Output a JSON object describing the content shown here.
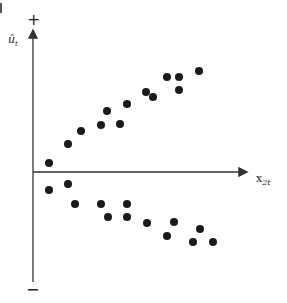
{
  "chart_data": {
    "type": "scatter",
    "title": "",
    "xlabel": "x_2t",
    "ylabel": "û_t",
    "x_axis_label": {
      "base": "x",
      "sub": "2t"
    },
    "y_axis_label": {
      "base": "û",
      "sub": "t"
    },
    "y_positive_marker": "+",
    "y_negative_marker": "−",
    "grid": false,
    "legend": null,
    "axis_origin_px": {
      "x": 33,
      "y": 172
    },
    "note": "Residuals fan out as x_2t increases (heteroscedasticity pattern); values are pixel-relative (x to the right of y-axis, y above x-axis).",
    "series": [
      {
        "name": "positive residuals",
        "points": [
          {
            "x": 16,
            "y": 9
          },
          {
            "x": 35,
            "y": 28
          },
          {
            "x": 48,
            "y": 41
          },
          {
            "x": 68,
            "y": 47
          },
          {
            "x": 74,
            "y": 61
          },
          {
            "x": 87,
            "y": 48
          },
          {
            "x": 94,
            "y": 68
          },
          {
            "x": 113,
            "y": 80
          },
          {
            "x": 120,
            "y": 75
          },
          {
            "x": 134,
            "y": 95
          },
          {
            "x": 146,
            "y": 95
          },
          {
            "x": 146,
            "y": 82
          },
          {
            "x": 166,
            "y": 101
          }
        ]
      },
      {
        "name": "negative residuals",
        "points": [
          {
            "x": 16,
            "y": -18
          },
          {
            "x": 35,
            "y": -12
          },
          {
            "x": 42,
            "y": -32
          },
          {
            "x": 68,
            "y": -32
          },
          {
            "x": 75,
            "y": -45
          },
          {
            "x": 94,
            "y": -32
          },
          {
            "x": 94,
            "y": -45
          },
          {
            "x": 114,
            "y": -51
          },
          {
            "x": 141,
            "y": -50
          },
          {
            "x": 134,
            "y": -64
          },
          {
            "x": 167,
            "y": -57
          },
          {
            "x": 160,
            "y": -70
          },
          {
            "x": 180,
            "y": -70
          }
        ]
      }
    ],
    "xlim": [
      0,
      215
    ],
    "ylim": [
      -108,
      144
    ]
  },
  "labels": {
    "plus": "+",
    "minus": "−",
    "y_base": "û",
    "y_sub": "t",
    "x_base": "x",
    "x_sub": "2t"
  },
  "style": {
    "point_color": "#1a1a1a",
    "axis_color": "#333333",
    "point_radius": 4
  }
}
